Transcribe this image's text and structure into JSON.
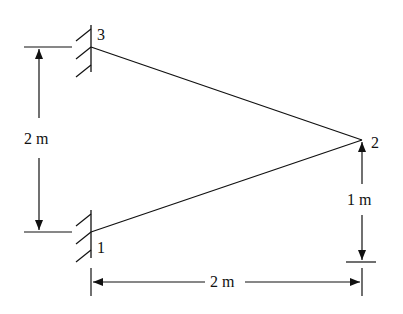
{
  "diagram": {
    "type": "truss",
    "nodes": [
      {
        "id": "1",
        "label": "1",
        "support": "fixed-wall"
      },
      {
        "id": "2",
        "label": "2",
        "support": "none"
      },
      {
        "id": "3",
        "label": "3",
        "support": "fixed-wall"
      }
    ],
    "members": [
      {
        "from": "1",
        "to": "2"
      },
      {
        "from": "3",
        "to": "2"
      }
    ],
    "dimensions": {
      "vertical_left": "2 m",
      "vertical_right": "1 m",
      "horizontal_bottom": "2 m"
    }
  }
}
